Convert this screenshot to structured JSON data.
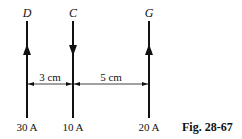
{
  "wires": [
    {
      "name": "D",
      "current": "30 A",
      "direction": "up",
      "x": 27
    },
    {
      "name": "C",
      "current": "10 A",
      "direction": "down",
      "x": 73
    },
    {
      "name": "G",
      "current": "20 A",
      "direction": "up",
      "x": 149
    }
  ],
  "dimensions": [
    {
      "label": "3 cm",
      "from": "D",
      "to": "C"
    },
    {
      "label": "5 cm",
      "from": "C",
      "to": "G"
    }
  ],
  "caption": "Fig. 28-67"
}
